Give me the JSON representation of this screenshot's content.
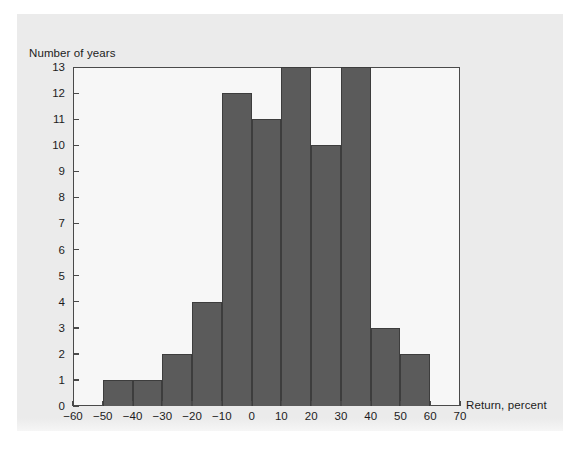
{
  "figure": {
    "y_axis_title": "Number of years",
    "x_axis_title": "Return, percent",
    "bar_color": "#5b5b5b",
    "bar_edge_color": "#3d3d3d",
    "plot_background": "#f7f7f7",
    "panel_background": "#ebebeb",
    "axis_color": "#4a4a4a"
  },
  "chart_data": {
    "type": "bar",
    "title": "",
    "xlabel": "Return, percent",
    "ylabel": "Number of years",
    "xlim": [
      -60,
      70
    ],
    "ylim": [
      0,
      13
    ],
    "grid": false,
    "legend": null,
    "bin_width": 10,
    "bin_edges": [
      -60,
      -50,
      -40,
      -30,
      -20,
      -10,
      0,
      10,
      20,
      30,
      40,
      50,
      60,
      70
    ],
    "categories": [
      "-60 to -50",
      "-50 to -40",
      "-40 to -30",
      "-30 to -20",
      "-20 to -10",
      "-10 to 0",
      "0 to 10",
      "10 to 20",
      "20 to 30",
      "30 to 40",
      "40 to 50",
      "50 to 60",
      "60 to 70"
    ],
    "values": [
      0,
      1,
      1,
      2,
      4,
      12,
      11,
      13,
      10,
      13,
      3,
      2,
      0
    ],
    "xticks": [
      "-60",
      "-50",
      "-40",
      "-30",
      "-20",
      "-10",
      "0",
      "10",
      "20",
      "30",
      "40",
      "50",
      "60",
      "70"
    ],
    "xtick_values": [
      -60,
      -50,
      -40,
      -30,
      -20,
      -10,
      0,
      10,
      20,
      30,
      40,
      50,
      60,
      70
    ],
    "yticks": [
      "0",
      "1",
      "2",
      "3",
      "4",
      "5",
      "6",
      "7",
      "8",
      "9",
      "10",
      "11",
      "12",
      "13"
    ],
    "ytick_values": [
      0,
      1,
      2,
      3,
      4,
      5,
      6,
      7,
      8,
      9,
      10,
      11,
      12,
      13
    ]
  }
}
